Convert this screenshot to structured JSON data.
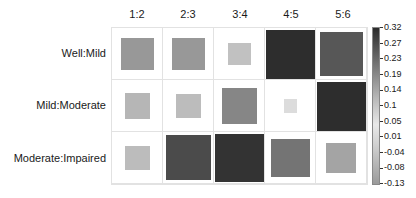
{
  "chart_data": {
    "type": "heatmap",
    "title": "",
    "columns": [
      "1:2",
      "2:3",
      "3:4",
      "4:5",
      "5:6"
    ],
    "rows": [
      "Well:Mild",
      "Mild:Moderate",
      "Moderate:Impaired"
    ],
    "values": [
      [
        0.14,
        0.14,
        0.07,
        0.32,
        0.25
      ],
      [
        0.09,
        0.08,
        0.17,
        0.01,
        0.32
      ],
      [
        0.08,
        0.27,
        0.31,
        0.2,
        0.12
      ]
    ],
    "colorbar": {
      "min": -0.13,
      "max": 0.32,
      "ticks": [
        "0.32",
        "0.27",
        "0.23",
        "0.19",
        "0.14",
        "0.1",
        "0.05",
        "0.01",
        "-0.04",
        "-0.08",
        "-0.13"
      ]
    },
    "encoding": "square size and grayscale shade proportional to value",
    "grid": true,
    "legend_position": "right"
  }
}
